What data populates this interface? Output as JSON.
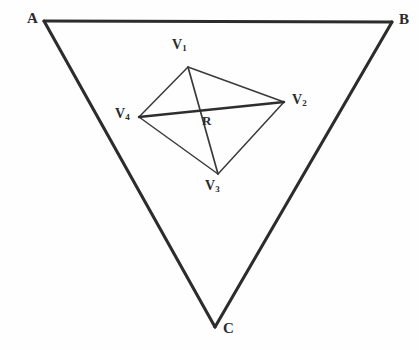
{
  "figure": {
    "background_color": "#fefefe",
    "line_color": "#2c2c2c",
    "label_color": "#2b2b2b"
  },
  "triangle": {
    "name": "outer-triangle",
    "vertices": [
      {
        "id": "A",
        "label": "A",
        "x": 44,
        "y": 21
      },
      {
        "id": "B",
        "label": "B",
        "x": 392,
        "y": 22
      },
      {
        "id": "C",
        "label": "C",
        "x": 215,
        "y": 327
      }
    ],
    "edges": [
      {
        "from": "A",
        "to": "B",
        "name": "edge-ab"
      },
      {
        "from": "B",
        "to": "C",
        "name": "edge-bc"
      },
      {
        "from": "C",
        "to": "A",
        "name": "edge-ca"
      }
    ],
    "path": "M 44 21 L 392 22 L 215 327 Z"
  },
  "quadrilateral": {
    "name": "inner-quadrilateral",
    "vertices": [
      {
        "id": "V1",
        "label": "V",
        "subscript": "1",
        "x": 188,
        "y": 67
      },
      {
        "id": "V2",
        "label": "V",
        "subscript": "2",
        "x": 284,
        "y": 102
      },
      {
        "id": "V3",
        "label": "V",
        "subscript": "3",
        "x": 218,
        "y": 174
      },
      {
        "id": "V4",
        "label": "V",
        "subscript": "4",
        "x": 139,
        "y": 117
      }
    ],
    "edges": [
      {
        "from": "V1",
        "to": "V2",
        "name": "edge-v1-v2"
      },
      {
        "from": "V2",
        "to": "V3",
        "name": "edge-v2-v3"
      },
      {
        "from": "V3",
        "to": "V4",
        "name": "edge-v3-v4"
      },
      {
        "from": "V4",
        "to": "V1",
        "name": "edge-v4-v1"
      }
    ],
    "path": "M 188 67 L 284 102 L 218 174 L 139 117 Z"
  },
  "diagonals": [
    {
      "id": "d1",
      "name": "diagonal-v1-v3",
      "from": "V1",
      "to": "V3",
      "x1": 188,
      "y1": 67,
      "x2": 218,
      "y2": 174,
      "weight": "thin"
    },
    {
      "id": "d2",
      "name": "diagonal-v4-v2",
      "from": "V4",
      "to": "V2",
      "x1": 139,
      "y1": 117,
      "x2": 284,
      "y2": 102,
      "weight": "thick"
    }
  ],
  "interior_point": {
    "id": "R",
    "label": "R",
    "x": 200,
    "y": 113,
    "description": "intersection of diagonals V1V3 and V4V2"
  }
}
